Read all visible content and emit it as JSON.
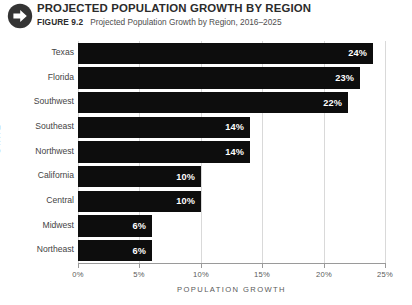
{
  "header": {
    "icon": "arrow-circle-right-icon",
    "main_title": "PROJECTED POPULATION GROWTH BY REGION",
    "figure_number": "FIGURE 9.2",
    "figure_caption": "Projected Population Growth by Region, 2016–2025"
  },
  "colors": {
    "bar": "#0d0d0d",
    "bar_label": "#ffffff",
    "gridline": "#d9d9d9",
    "axis": "#9a9a9a",
    "title": "#2b2b2b",
    "text": "#4d4d4d"
  },
  "chart_data": {
    "type": "bar",
    "orientation": "horizontal",
    "title": "Projected Population Growth by Region, 2016–2025",
    "categories": [
      "Texas",
      "Florida",
      "Southwest",
      "Southeast",
      "Northwest",
      "California",
      "Central",
      "Midwest",
      "Northeast"
    ],
    "values": [
      24,
      23,
      22,
      14,
      14,
      10,
      10,
      6,
      6
    ],
    "value_labels": [
      "24%",
      "23%",
      "22%",
      "14%",
      "14%",
      "10%",
      "10%",
      "6%",
      "6%"
    ],
    "xlabel": "POPULATION GROWTH",
    "ylabel": "STATE",
    "xlim": [
      0,
      25
    ],
    "xticks": [
      0,
      5,
      10,
      15,
      20,
      25
    ],
    "xtick_labels": [
      "0%",
      "5%",
      "10%",
      "15%",
      "20%",
      "25%"
    ],
    "grid": "vertical",
    "legend": "none"
  }
}
